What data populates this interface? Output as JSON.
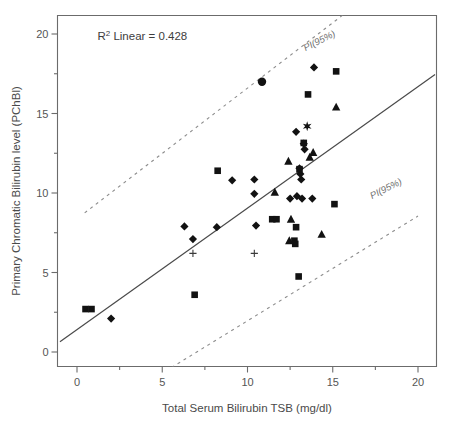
{
  "chart_data": {
    "type": "scatter",
    "title": "",
    "xlabel": "Total Serum Bilirubin TSB (mg/dl)",
    "ylabel": "Primary Chromatic Bilirubin level (PChBl)",
    "xlim": [
      -1.0,
      21.0
    ],
    "ylim": [
      -1.2,
      21.2
    ],
    "xticks": [
      0,
      5,
      10,
      15,
      20
    ],
    "xtick_labels": [
      "0",
      "5",
      "10",
      "15",
      "20"
    ],
    "yticks": [
      0,
      5,
      10,
      15,
      20
    ],
    "ytick_labels": [
      "0",
      "5",
      "10",
      "15",
      "20"
    ],
    "minor_yticks": [
      2.5,
      7.5,
      12.5,
      17.5
    ],
    "grid": false,
    "legend": "none",
    "annotations": [
      {
        "name": "r-squared",
        "text_prefix": "R",
        "text_sup": "2",
        "text_suffix": " Linear = 0.428",
        "x": 1.2,
        "y": 19.6
      },
      {
        "name": "upper-prediction-interval-label",
        "text": "PI(95%)",
        "x": 14.3,
        "y": 19.4,
        "rotation": -27
      },
      {
        "name": "lower-prediction-interval-label",
        "text": "PI(95%)",
        "x": 18.2,
        "y": 10.1,
        "rotation": -27
      }
    ],
    "fit_line": {
      "name": "linear-regression-line",
      "label": "Linear fit",
      "r_squared": 0.428,
      "x_start": -1.0,
      "y_start": 0.65,
      "x_end": 21.0,
      "y_end": 17.45,
      "slope": 0.764,
      "intercept": 1.414,
      "style": "solid"
    },
    "prediction_intervals": [
      {
        "name": "upper-pi-95",
        "label": "PI(95%)",
        "level": 95,
        "style": "dashed",
        "x_start": 0.45,
        "y_start": 8.75,
        "x_end": 15.6,
        "y_end": 21.2
      },
      {
        "name": "lower-pi-95",
        "label": "PI(95%)",
        "level": 95,
        "style": "dashed",
        "x_start": 5.2,
        "y_start": -1.2,
        "x_end": 20.0,
        "y_end": 8.55
      }
    ],
    "series": [
      {
        "name": "diamond-series",
        "marker": "diamond",
        "points": [
          [
            2.0,
            2.1
          ],
          [
            6.3,
            7.9
          ],
          [
            6.8,
            7.1
          ],
          [
            8.2,
            7.85
          ],
          [
            9.1,
            10.8
          ],
          [
            10.4,
            10.85
          ],
          [
            10.4,
            9.95
          ],
          [
            10.5,
            7.95
          ],
          [
            12.5,
            9.65
          ],
          [
            12.9,
            9.8
          ],
          [
            13.2,
            9.65
          ],
          [
            13.8,
            9.65
          ],
          [
            12.85,
            13.85
          ],
          [
            13.3,
            13.1
          ],
          [
            13.35,
            12.75
          ],
          [
            13.05,
            11.55
          ],
          [
            13.1,
            11.2
          ],
          [
            13.15,
            10.85
          ],
          [
            13.9,
            17.9
          ]
        ]
      },
      {
        "name": "square-series",
        "marker": "square",
        "points": [
          [
            0.5,
            2.7
          ],
          [
            0.85,
            2.7
          ],
          [
            6.9,
            3.6
          ],
          [
            8.25,
            11.4
          ],
          [
            11.45,
            8.35
          ],
          [
            11.7,
            8.35
          ],
          [
            12.85,
            7.85
          ],
          [
            12.75,
            7.0
          ],
          [
            12.8,
            6.8
          ],
          [
            13.0,
            4.75
          ],
          [
            13.05,
            11.5
          ],
          [
            13.3,
            13.15
          ],
          [
            13.55,
            16.2
          ],
          [
            15.1,
            9.3
          ],
          [
            15.2,
            17.65
          ]
        ]
      },
      {
        "name": "triangle-series",
        "marker": "triangle",
        "points": [
          [
            11.6,
            10.05
          ],
          [
            12.4,
            12.0
          ],
          [
            12.55,
            8.35
          ],
          [
            12.45,
            7.0
          ],
          [
            13.65,
            12.25
          ],
          [
            13.85,
            12.55
          ],
          [
            14.35,
            7.4
          ],
          [
            15.2,
            15.4
          ]
        ]
      },
      {
        "name": "circle-series",
        "marker": "circle",
        "points": [
          [
            10.85,
            17.0
          ]
        ]
      },
      {
        "name": "star-series",
        "marker": "star",
        "points": [
          [
            13.5,
            14.2
          ]
        ]
      },
      {
        "name": "plus-series",
        "marker": "plus",
        "points": [
          [
            6.8,
            6.2
          ],
          [
            10.4,
            6.2
          ]
        ]
      }
    ]
  }
}
